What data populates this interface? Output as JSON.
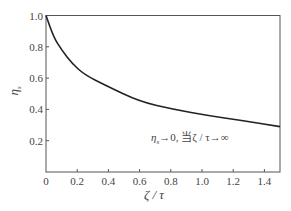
{
  "chart_data": {
    "type": "line",
    "title": "",
    "xlabel": "ζ/τ",
    "ylabel": "η_s",
    "xlim": [
      0,
      1.5
    ],
    "ylim": [
      0,
      1.0
    ],
    "grid": false,
    "x_ticks": [
      "0",
      "0.2",
      "0.4",
      "0.6",
      "0.8",
      "1.0",
      "1.2",
      "1.4"
    ],
    "y_ticks": [
      "0.2",
      "0.4",
      "0.6",
      "0.8",
      "1.0"
    ],
    "series": [
      {
        "name": "η_s",
        "x": [
          0,
          0.05,
          0.1,
          0.17,
          0.25,
          0.39,
          0.6,
          0.82,
          1.04,
          1.25,
          1.5
        ],
        "values": [
          1.0,
          0.86,
          0.78,
          0.69,
          0.62,
          0.55,
          0.45,
          0.4,
          0.36,
          0.33,
          0.29
        ]
      }
    ],
    "annotations": [
      "η_s→0, 当ζ/τ→∞"
    ]
  },
  "labels": {
    "xlabel": "ζ / τ",
    "ylabel": "η",
    "ylabel_sub": "s",
    "annotation_eta": "η",
    "annotation_sub": "s",
    "annotation_rest": "→0, 当ζ / τ→∞"
  }
}
